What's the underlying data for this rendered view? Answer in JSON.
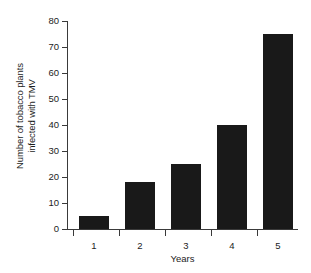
{
  "chart_data": {
    "type": "bar",
    "title": "",
    "subtitle": "",
    "categories": [
      "1",
      "2",
      "3",
      "4",
      "5"
    ],
    "values": [
      5,
      18,
      25,
      40,
      75
    ],
    "series": [
      {
        "name": "Number of tobacco plants infected with TMV",
        "values": [
          5,
          18,
          25,
          40,
          75
        ]
      }
    ],
    "xlabel": "Years",
    "ylabel": "Number of tobacco plants infected with TMV",
    "ylabel_lines": [
      "Number of tobacco plants",
      "infected with TMV"
    ],
    "yticks": [
      0,
      10,
      20,
      30,
      40,
      50,
      60,
      70,
      80
    ],
    "ytick_labels": [
      "0",
      "10",
      "20",
      "30",
      "40",
      "50",
      "60",
      "70",
      "80"
    ],
    "ylim": [
      0,
      80
    ],
    "grid": false,
    "legend": false,
    "legend_position": "none",
    "bar_color": "#191919",
    "axis_color": "#3a3a3a",
    "background_color": "#ffffff",
    "annotations": []
  }
}
